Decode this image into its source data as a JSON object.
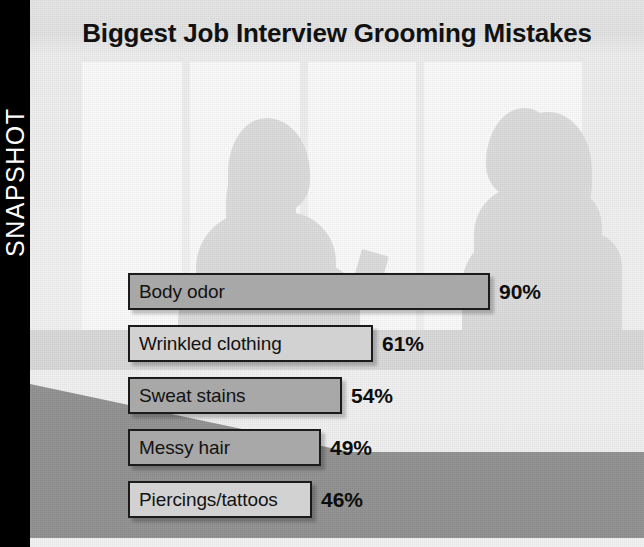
{
  "rail": {
    "label": "SNAPSHOT"
  },
  "title": "Biggest Job Interview Grooming Mistakes",
  "colors": {
    "rail_background": "#000000",
    "bar_dark_fill": "#a8a8a8",
    "bar_light_fill": "#d2d2d2",
    "bar_outline": "#1b1b1b",
    "value_text": "#0d0d0d",
    "photo_highlight": "#fbfbfb",
    "desk_shadow": "#919191"
  },
  "scene": {
    "description": "job-interview-silhouettes-photo",
    "figures": [
      "interviewee-silhouette",
      "interviewer-silhouette"
    ],
    "props": [
      "resume-paper",
      "window-panes",
      "desk-surface"
    ]
  },
  "chart_data": {
    "type": "bar",
    "orientation": "horizontal",
    "title": "Biggest Job Interview Grooming Mistakes",
    "xlabel": "",
    "ylabel": "",
    "xlim": [
      0,
      100
    ],
    "grid": false,
    "legend": false,
    "value_suffix": "%",
    "categories": [
      "Body odor",
      "Wrinkled clothing",
      "Sweat stains",
      "Messy hair",
      "Piercings/tattoos"
    ],
    "values": [
      90,
      61,
      54,
      49,
      46
    ],
    "value_labels": [
      "90%",
      "61%",
      "54%",
      "49%",
      "46%"
    ],
    "bars": [
      {
        "label": "Body odor",
        "value": 90,
        "value_label": "90%",
        "fill": "#a8a8a8",
        "width_px": 362,
        "top_px": 273
      },
      {
        "label": "Wrinkled clothing",
        "value": 61,
        "value_label": "61%",
        "fill": "#d2d2d2",
        "width_px": 245,
        "top_px": 325
      },
      {
        "label": "Sweat stains",
        "value": 54,
        "value_label": "54%",
        "fill": "#a8a8a8",
        "width_px": 214,
        "top_px": 377
      },
      {
        "label": "Messy hair",
        "value": 49,
        "value_label": "49%",
        "fill": "#a8a8a8",
        "width_px": 193,
        "top_px": 429
      },
      {
        "label": "Piercings/tattoos",
        "value": 46,
        "value_label": "46%",
        "fill": "#d2d2d2",
        "width_px": 184,
        "top_px": 481
      }
    ]
  }
}
